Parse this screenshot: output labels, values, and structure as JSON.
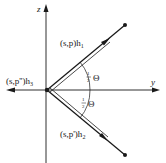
{
  "diagram": {
    "axes": {
      "z_label": "z",
      "y_label": "y"
    },
    "vectors": {
      "upper": {
        "label_main": "(s,p)h",
        "label_sub": "1"
      },
      "left": {
        "label_main": "(s,p'')h",
        "label_sub": "3"
      },
      "lower": {
        "label_main": "(s,p')h",
        "label_sub": "2"
      }
    },
    "angles": {
      "upper": {
        "fraction_num": "1",
        "fraction_den": "2",
        "symbol": "Θ"
      },
      "lower": {
        "fraction_num": "1",
        "fraction_den": "2",
        "symbol": "Θ"
      }
    },
    "colors": {
      "ink": "#1a1a1a",
      "background": "#ffffff"
    }
  }
}
